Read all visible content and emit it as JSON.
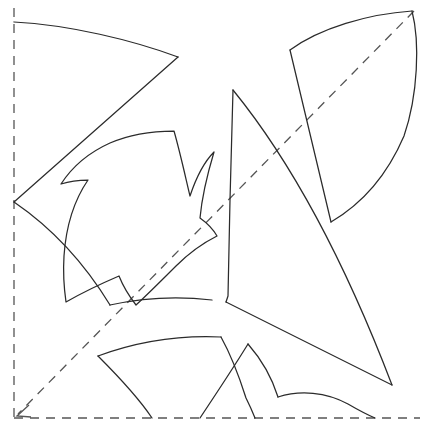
{
  "figure": {
    "width": 423,
    "height": 431,
    "background_color": "#ffffff",
    "outline_color": "#2b2b2b",
    "axis_color": "#555555",
    "outline_width": 1.25,
    "axis_dash": "9 7"
  },
  "axes": {
    "vertical_mirror": {
      "name": "left vertical dashed axis",
      "path": "M 14 8 L 14 418"
    },
    "horizontal_mirror": {
      "name": "bottom horizontal dashed axis",
      "path": "M 14 418 L 420 418"
    },
    "diagonal_mirror": {
      "name": "diagonal dashed axis with arrowhead",
      "path": "M 414 11 L 18 414"
    },
    "arrowhead": {
      "name": "arrowhead at lower-left of diagonal",
      "path": "M 29 405 L 17 416 L 31 417"
    }
  },
  "shapes": [
    {
      "name": "upper-left-petal-sector",
      "path": "M 14 22 C 70 25 132 40 178 57 L 14 202 C 14 202 14 100 14 22 Z"
    },
    {
      "name": "upper-right-curved-quad",
      "path": "M 290 50 C 320 28 368 14 412 11 C 420 42 418 95 404 136 C 386 178 360 205 331 222 C 318 180 305 112 290 50 Z"
    },
    {
      "name": "center-fleur-de-lis",
      "path": "M 174 131 C 180 152 185 175 190 196 C 196 178 204 162 214 152 C 208 172 202 196 200 218 C 207 223 213 229 217 236 C 205 242 190 252 176 266 C 160 282 147 295 136 305 C 129 296 123 286 119 276 C 98 285 80 294 66 302 C 64 288 63 272 64 256 C 66 226 75 199 88 180 C 79 180 70 181 61 184 C 72 167 90 152 110 143 C 128 135 150 131 174 131 Z"
    },
    {
      "name": "left-lower-crescent",
      "path": "M 14 202 C 52 228 85 264 110 305 C 142 298 178 296 212 300 C 216 312 220 324 223 336 C 180 334 137 340 100 354 C 80 320 51 272 14 232 Z"
    },
    {
      "name": "center-large-sector",
      "path": "M 233 90 C 290 160 345 262 392 385 L 226 302 L 228 296 L 230 200 Z"
    },
    {
      "name": "lower-left-arc-band",
      "path": "M 98 356 C 136 342 178 335 221 337 C 231 355 239 376 246 398 C 234 404 222 411 212 418 L 152 418 C 141 396 123 373 98 356 Z"
    },
    {
      "name": "lower-center-fin",
      "path": "M 248 344 C 262 360 272 378 278 397 C 300 390 326 392 348 404 C 356 409 363 413 368 418 L 200 418 C 212 402 230 372 248 344 Z"
    }
  ],
  "strokes": [
    {
      "name": "upper-left-sector-top-arc",
      "path": "M 14 22 C 70 25 132 40 178 57"
    },
    {
      "name": "upper-left-sector-diagonal-edge",
      "path": "M 178 57 L 14 202"
    },
    {
      "name": "upper-right-quad-top-arc",
      "path": "M 290 50 C 320 28 368 14 412 11"
    },
    {
      "name": "upper-right-quad-right-arc",
      "path": "M 412 11 C 420 42 418 95 404 136 C 386 178 360 205 331 222"
    },
    {
      "name": "upper-right-quad-left-edge",
      "path": "M 290 50 L 331 222"
    },
    {
      "name": "fleur-outline",
      "path": "M 174 131 C 180 152 185 175 190 196 C 196 178 204 162 214 152 C 208 172 202 196 200 218 C 207 223 213 229 217 236 C 205 242 190 252 176 266 C 160 282 147 295 136 305 C 129 296 123 286 119 276 C 98 285 80 294 66 302 C 64 288 63 272 64 256 C 66 226 75 199 88 180 C 79 180 70 181 61 184 C 72 167 90 152 110 143 C 128 135 150 131 174 131 Z"
    },
    {
      "name": "left-crescent-upper-arc",
      "path": "M 14 202 C 52 228 85 264 110 305"
    },
    {
      "name": "left-crescent-inner-arc",
      "path": "M 110 305 C 142 298 178 296 212 300"
    },
    {
      "name": "center-sector-left-edge",
      "path": "M 233 90 L 230 200 L 228 296 L 226 302"
    },
    {
      "name": "center-sector-outer-arc",
      "path": "M 233 90 C 290 160 345 262 392 385"
    },
    {
      "name": "center-sector-bottom-edge",
      "path": "M 226 302 L 392 385"
    },
    {
      "name": "lower-band-top-arc",
      "path": "M 98 356 C 136 342 178 335 221 337"
    },
    {
      "name": "lower-band-right-curve",
      "path": "M 221 337 C 231 355 239 376 246 398 C 250 406 253 413 255 418"
    },
    {
      "name": "lower-band-left-curve",
      "path": "M 98 356 C 120 378 140 400 152 418"
    },
    {
      "name": "lower-fin-left-edge",
      "path": "M 248 344 C 232 370 212 400 200 418"
    },
    {
      "name": "lower-fin-right-curve",
      "path": "M 248 344 C 262 360 272 378 278 397"
    },
    {
      "name": "lower-fin-foot-arc",
      "path": "M 278 397 C 300 390 326 392 348 404 C 360 411 368 415 375 418"
    }
  ]
}
